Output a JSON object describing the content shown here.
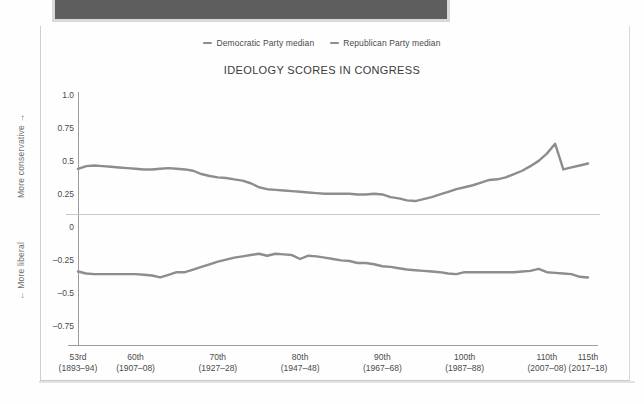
{
  "window": {
    "topbar_color": "#5e5e5e"
  },
  "chart": {
    "title": "IDEOLOGY SCORES IN CONGRESS",
    "legend": [
      {
        "label": "Democratic Party median",
        "color": "#8d8d8d"
      },
      {
        "label": "Republican Party median",
        "color": "#8d8d8d"
      }
    ],
    "axis_caption_top": "More conservative →",
    "axis_caption_bottom": "← More liberal"
  },
  "chart_data": {
    "type": "line",
    "title": "IDEOLOGY SCORES IN CONGRESS",
    "xlabel": "",
    "ylabel": "",
    "grid": false,
    "legend_position": "top",
    "ylim": [
      -0.875,
      1.0
    ],
    "yticks": [
      "1.0",
      "0.75",
      "0.5",
      "0.25",
      "0",
      "-0.25",
      "-0.5",
      "-0.75"
    ],
    "ytick_values": [
      1.0,
      0.75,
      0.5,
      0.25,
      0,
      -0.25,
      -0.5,
      -0.75
    ],
    "xtick_labels": [
      {
        "congress": "53rd",
        "years": "(1893–94)"
      },
      {
        "congress": "60th",
        "years": "(1907–08)"
      },
      {
        "congress": "70th",
        "years": "(1927–28)"
      },
      {
        "congress": "80th",
        "years": "(1947–48)"
      },
      {
        "congress": "90th",
        "years": "(1967–68)"
      },
      {
        "congress": "100th",
        "years": "(1987–88)"
      },
      {
        "congress": "110th",
        "years": "(2007–08)"
      },
      {
        "congress": "115th",
        "years": "(2017–18)"
      }
    ],
    "x": [
      53,
      54,
      55,
      56,
      57,
      58,
      59,
      60,
      61,
      62,
      63,
      64,
      65,
      66,
      67,
      68,
      69,
      70,
      71,
      72,
      73,
      74,
      75,
      76,
      77,
      78,
      79,
      80,
      81,
      82,
      83,
      84,
      85,
      86,
      87,
      88,
      89,
      90,
      91,
      92,
      73,
      74,
      95,
      96,
      97,
      98,
      99,
      100,
      101,
      102,
      103,
      104,
      105,
      106,
      107,
      108,
      109,
      110,
      111,
      112,
      113,
      114,
      115
    ],
    "x_index": [
      53,
      54,
      55,
      56,
      57,
      58,
      59,
      60,
      61,
      62,
      63,
      64,
      65,
      66,
      67,
      68,
      69,
      70,
      71,
      72,
      73,
      74,
      75,
      76,
      77,
      78,
      79,
      80,
      81,
      82,
      83,
      84,
      85,
      86,
      87,
      88,
      89,
      90,
      91,
      92,
      93,
      94,
      95,
      96,
      97,
      98,
      99,
      100,
      101,
      102,
      103,
      104,
      105,
      106,
      107,
      108,
      109,
      110,
      111,
      112,
      113,
      114,
      115
    ],
    "series": [
      {
        "name": "Republican Party median",
        "color": "#8d8d8d",
        "values": [
          0.44,
          0.46,
          0.465,
          0.46,
          0.455,
          0.45,
          0.445,
          0.44,
          0.435,
          0.435,
          0.44,
          0.445,
          0.44,
          0.435,
          0.425,
          0.4,
          0.385,
          0.375,
          0.37,
          0.36,
          0.35,
          0.33,
          0.3,
          0.285,
          0.28,
          0.275,
          0.27,
          0.265,
          0.26,
          0.255,
          0.25,
          0.25,
          0.25,
          0.25,
          0.245,
          0.245,
          0.25,
          0.245,
          0.225,
          0.215,
          0.2,
          0.195,
          0.21,
          0.225,
          0.245,
          0.265,
          0.285,
          0.3,
          0.315,
          0.335,
          0.355,
          0.36,
          0.375,
          0.4,
          0.425,
          0.46,
          0.5,
          0.555,
          0.63,
          0.435,
          0.45,
          0.465,
          0.48
        ]
      },
      {
        "name": "Democratic Party median",
        "color": "#8d8d8d",
        "values": [
          -0.34,
          -0.355,
          -0.36,
          -0.36,
          -0.36,
          -0.36,
          -0.36,
          -0.36,
          -0.365,
          -0.37,
          -0.385,
          -0.365,
          -0.345,
          -0.345,
          -0.325,
          -0.305,
          -0.285,
          -0.265,
          -0.25,
          -0.235,
          -0.225,
          -0.215,
          -0.205,
          -0.22,
          -0.205,
          -0.21,
          -0.215,
          -0.245,
          -0.22,
          -0.225,
          -0.235,
          -0.245,
          -0.255,
          -0.26,
          -0.275,
          -0.275,
          -0.285,
          -0.3,
          -0.305,
          -0.315,
          -0.325,
          -0.33,
          -0.335,
          -0.34,
          -0.345,
          -0.355,
          -0.36,
          -0.345,
          -0.345,
          -0.345,
          -0.345,
          -0.345,
          -0.345,
          -0.345,
          -0.34,
          -0.335,
          -0.32,
          -0.345,
          -0.35,
          -0.355,
          -0.36,
          -0.38,
          -0.385
        ]
      }
    ]
  }
}
